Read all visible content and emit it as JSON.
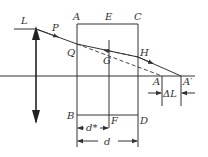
{
  "diagram": {
    "title": "",
    "labels": {
      "lens": "L",
      "P": "P",
      "Q": "Q",
      "A_top": "A",
      "E": "E",
      "C": "C",
      "G": "G",
      "H": "H",
      "A_axis": "A",
      "A_prime": "A′",
      "B": "B",
      "F": "F",
      "D": "D",
      "d_star": "d*",
      "d": "d",
      "delta_L": "ΔL"
    },
    "colors": {
      "line": "#333333",
      "background": "#ffffff"
    }
  }
}
